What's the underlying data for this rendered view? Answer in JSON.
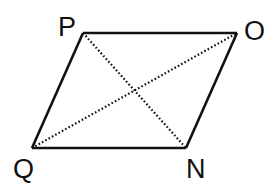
{
  "diagram": {
    "type": "parallelogram-with-diagonals",
    "vertices": {
      "P": {
        "label": "P",
        "x": 83,
        "y": 33,
        "label_x": 58,
        "label_y": 36
      },
      "O": {
        "label": "O",
        "x": 237,
        "y": 33,
        "label_x": 244,
        "label_y": 40
      },
      "N": {
        "label": "N",
        "x": 186,
        "y": 148,
        "label_x": 186,
        "label_y": 178
      },
      "Q": {
        "label": "Q",
        "x": 32,
        "y": 148,
        "label_x": 13,
        "label_y": 178
      }
    },
    "sides": [
      {
        "from": "P",
        "to": "O",
        "style": "solid"
      },
      {
        "from": "O",
        "to": "N",
        "style": "solid"
      },
      {
        "from": "N",
        "to": "Q",
        "style": "solid"
      },
      {
        "from": "Q",
        "to": "P",
        "style": "solid"
      }
    ],
    "diagonals": [
      {
        "from": "P",
        "to": "N",
        "style": "dotted"
      },
      {
        "from": "Q",
        "to": "O",
        "style": "dotted"
      }
    ],
    "colors": {
      "line": "#111111",
      "background": "#ffffff"
    }
  }
}
